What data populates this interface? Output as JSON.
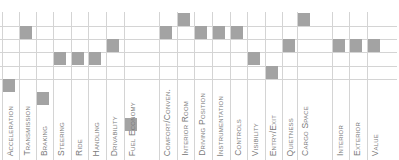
{
  "chart_data": {
    "type": "heatmap",
    "title": "",
    "row_levels": 9,
    "categories": [
      "Acceleration",
      "Transmission",
      "Braking",
      "Steering",
      "Ride",
      "Handling",
      "Drivability",
      "Fuel Economy",
      "Comfort/Conven.",
      "Interior Room",
      "Driving Position",
      "Instrumentation",
      "Controls",
      "Visibility",
      "Entry/Exit",
      "Quietness",
      "Cargo Space",
      "Interior",
      "Exterior",
      "Value"
    ],
    "values": [
      6,
      2,
      7,
      4,
      4,
      4,
      3,
      9,
      2,
      1,
      2,
      2,
      2,
      4,
      5,
      3,
      1,
      3,
      3,
      3
    ],
    "groups": [
      [
        "Acceleration",
        "Transmission",
        "Braking",
        "Steering",
        "Ride",
        "Handling",
        "Drivability",
        "Fuel Economy"
      ],
      [
        "Comfort/Conven.",
        "Interior Room",
        "Driving Position",
        "Instrumentation",
        "Controls",
        "Visibility",
        "Entry/Exit",
        "Quietness",
        "Cargo Space"
      ],
      [
        "Interior",
        "Exterior",
        "Value"
      ]
    ],
    "grid": true,
    "legend": null
  },
  "colors": {
    "marker": "#a3a3a3",
    "grid": "#d4d4d4",
    "label": "#7a7a7a"
  }
}
